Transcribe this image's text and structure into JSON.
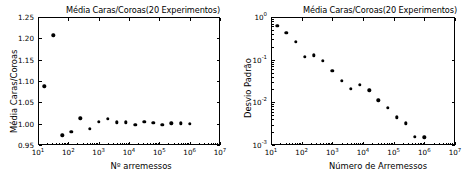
{
  "figure": {
    "background": "#ffffff",
    "marker_color": "#000000",
    "axis_color": "#000000"
  },
  "chart_data": [
    {
      "id": "left",
      "type": "scatter",
      "title": "Média Caras/Coroas(20 Experimentos)",
      "xlabel": "Nº arremessos",
      "ylabel": "Média Caras/Coroas",
      "xscale": "log",
      "yscale": "linear",
      "xlim": [
        10,
        10000000
      ],
      "ylim": [
        0.95,
        1.25
      ],
      "grid": false,
      "legend": null,
      "xticklabels": [
        "10¹",
        "10²",
        "10³",
        "10⁴",
        "10⁵",
        "10⁶",
        "10⁷"
      ],
      "xtickvalues": [
        10,
        100,
        1000,
        10000,
        100000,
        1000000,
        10000000
      ],
      "yticklabels": [
        "0.95",
        "1.00",
        "1.05",
        "1.10",
        "1.15",
        "1.20",
        "1.25"
      ],
      "ytickvalues": [
        0.95,
        1.0,
        1.05,
        1.1,
        1.15,
        1.2,
        1.25
      ],
      "x": [
        16,
        32,
        64,
        125,
        250,
        500,
        1000,
        2000,
        4000,
        8000,
        16000,
        32000,
        63000,
        125000,
        250000,
        500000,
        1000000
      ],
      "y": [
        1.088,
        1.207,
        0.973,
        0.981,
        1.013,
        0.988,
        1.005,
        1.012,
        1.003,
        1.003,
        0.997,
        1.004,
        1.002,
        0.998,
        1.001,
        1.001,
        1.0
      ]
    },
    {
      "id": "right",
      "type": "scatter",
      "title": "Média Caras/Coroas(20 Experimentos)",
      "xlabel": "Número de Arremessos",
      "ylabel": "Desvio Padrão",
      "xscale": "log",
      "yscale": "log",
      "xlim": [
        10,
        10000000
      ],
      "ylim": [
        0.001,
        1
      ],
      "grid": false,
      "legend": null,
      "xticklabels": [
        "10¹",
        "10²",
        "10³",
        "10⁴",
        "10⁵",
        "10⁶",
        "10⁷"
      ],
      "xtickvalues": [
        10,
        100,
        1000,
        10000,
        100000,
        1000000,
        10000000
      ],
      "yticklabels": [
        "10⁻³",
        "10⁻²",
        "10⁻¹",
        "10⁰"
      ],
      "ytickvalues": [
        0.001,
        0.01,
        0.1,
        1
      ],
      "x": [
        16,
        32,
        64,
        125,
        250,
        500,
        1000,
        2000,
        4000,
        8000,
        16000,
        32000,
        63000,
        125000,
        250000,
        500000,
        1000000
      ],
      "y": [
        0.62,
        0.42,
        0.26,
        0.118,
        0.127,
        0.094,
        0.055,
        0.032,
        0.0205,
        0.0255,
        0.0192,
        0.0112,
        0.0075,
        0.0045,
        0.0032,
        0.00155,
        0.0015
      ]
    }
  ]
}
